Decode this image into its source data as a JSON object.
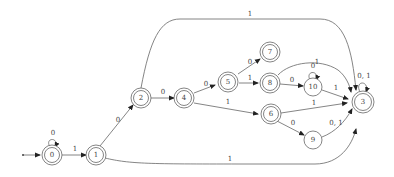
{
  "diagram": {
    "type": "finite-automaton",
    "start_state": "0",
    "states": [
      {
        "id": "0",
        "label": "0",
        "accepting": true
      },
      {
        "id": "1",
        "label": "1",
        "accepting": true
      },
      {
        "id": "2",
        "label": "2",
        "accepting": true
      },
      {
        "id": "4",
        "label": "4",
        "accepting": true
      },
      {
        "id": "5",
        "label": "5",
        "accepting": true
      },
      {
        "id": "7",
        "label": "7",
        "accepting": true
      },
      {
        "id": "8",
        "label": "8",
        "accepting": true
      },
      {
        "id": "6",
        "label": "6",
        "accepting": true
      },
      {
        "id": "10",
        "label": "10",
        "accepting": false
      },
      {
        "id": "9",
        "label": "9",
        "accepting": false
      },
      {
        "id": "3",
        "label": "3",
        "accepting": true
      }
    ],
    "edges": [
      {
        "from": "0",
        "to": "0",
        "label": "0"
      },
      {
        "from": "0",
        "to": "1",
        "label": "1"
      },
      {
        "from": "1",
        "to": "2",
        "label": "0"
      },
      {
        "from": "1",
        "to": "3",
        "label": "1"
      },
      {
        "from": "2",
        "to": "4",
        "label": "0"
      },
      {
        "from": "2",
        "to": "3",
        "label": "1"
      },
      {
        "from": "4",
        "to": "5",
        "label": "0"
      },
      {
        "from": "4",
        "to": "6",
        "label": "1"
      },
      {
        "from": "5",
        "to": "7",
        "label": "0"
      },
      {
        "from": "5",
        "to": "8",
        "label": "1"
      },
      {
        "from": "8",
        "to": "10",
        "label": "0"
      },
      {
        "from": "8",
        "to": "3",
        "label": "1"
      },
      {
        "from": "10",
        "to": "10",
        "label": "0"
      },
      {
        "from": "10",
        "to": "3",
        "label": "1"
      },
      {
        "from": "6",
        "to": "3",
        "label": "1"
      },
      {
        "from": "6",
        "to": "9",
        "label": "0"
      },
      {
        "from": "9",
        "to": "3",
        "label": "0, 1"
      },
      {
        "from": "3",
        "to": "3",
        "label": "0, 1"
      }
    ]
  }
}
